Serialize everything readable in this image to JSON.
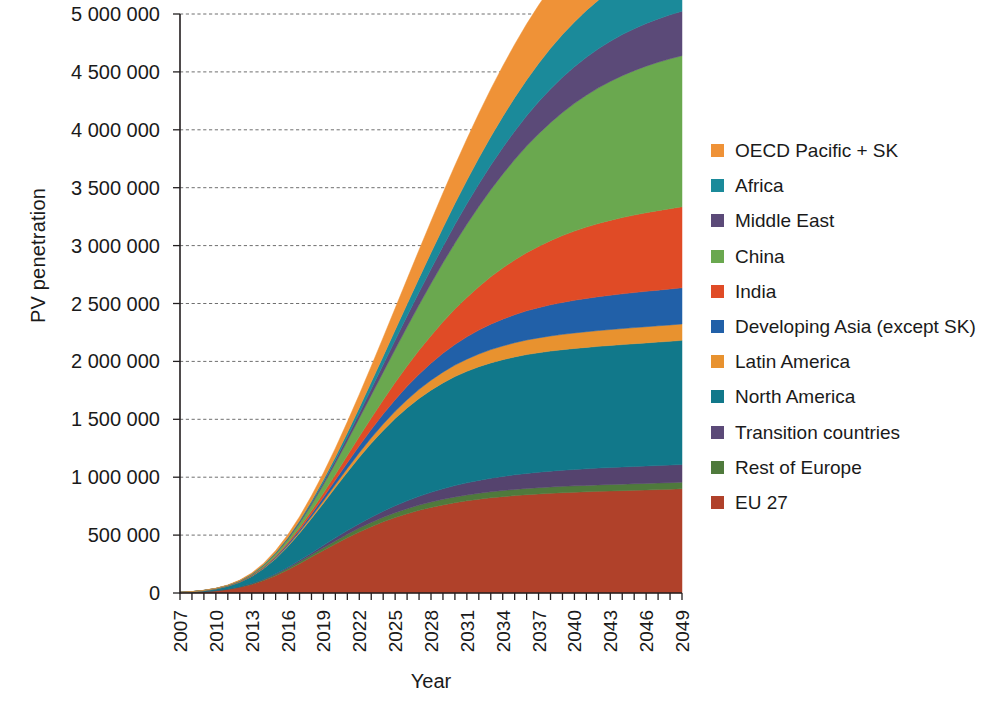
{
  "chart_data": {
    "type": "area",
    "title": "",
    "subtitle": "",
    "xlabel": "Year",
    "ylabel": "PV penetration",
    "xlim": [
      2007,
      2049
    ],
    "ylim": [
      0,
      5000000
    ],
    "grid": true,
    "stacked": true,
    "legend_position": "right",
    "y_tick_labels": [
      "5 000 000",
      "4 500 000",
      "4 000 000",
      "3 500 000",
      "3 000 000",
      "2 500 000",
      "2 000 000",
      "1 500 000",
      "1 000 000",
      "500 000",
      "0"
    ],
    "y_tick_values": [
      5000000,
      4500000,
      4000000,
      3500000,
      3000000,
      2500000,
      2000000,
      1500000,
      1000000,
      500000,
      0
    ],
    "x_tick_labels": [
      "2007",
      "2010",
      "2013",
      "2016",
      "2019",
      "2022",
      "2025",
      "2028",
      "2031",
      "2034",
      "2037",
      "2040",
      "2043",
      "2046",
      "2049"
    ],
    "x_tick_values": [
      2007,
      2010,
      2013,
      2016,
      2019,
      2022,
      2025,
      2028,
      2031,
      2034,
      2037,
      2040,
      2043,
      2046,
      2049
    ],
    "x_minor_step": 1,
    "x": [
      2007,
      2008,
      2009,
      2010,
      2011,
      2012,
      2013,
      2014,
      2015,
      2016,
      2017,
      2018,
      2019,
      2020,
      2021,
      2022,
      2023,
      2024,
      2025,
      2026,
      2027,
      2028,
      2029,
      2030,
      2031,
      2032,
      2033,
      2034,
      2035,
      2036,
      2037,
      2038,
      2039,
      2040,
      2041,
      2042,
      2043,
      2044,
      2045,
      2046,
      2047,
      2048,
      2049
    ],
    "series_order_bottom_to_top": [
      "EU 27",
      "Rest of Europe",
      "Transition countries",
      "North America",
      "Latin America",
      "Developing Asia (except SK)",
      "India",
      "China",
      "Middle East",
      "Africa",
      "OECD Pacific + SK"
    ],
    "series": [
      {
        "name": "EU 27",
        "color": "#b0412a",
        "values": [
          3000,
          6000,
          11000,
          19000,
          31000,
          49000,
          74000,
          108000,
          150000,
          199000,
          253000,
          310000,
          367000,
          423000,
          477000,
          527000,
          573000,
          615000,
          652000,
          685000,
          714000,
          739000,
          761000,
          780000,
          796000,
          810000,
          822000,
          832000,
          841000,
          849000,
          855000,
          861000,
          866000,
          870000,
          874000,
          878000,
          881000,
          884000,
          887000,
          890000,
          893000,
          896000,
          900000
        ]
      },
      {
        "name": "Rest of Europe",
        "color": "#4f7a3c",
        "values": [
          200,
          400,
          700,
          1200,
          2000,
          3100,
          4700,
          6900,
          9500,
          12600,
          16000,
          19600,
          23200,
          26800,
          30200,
          33400,
          36300,
          38900,
          41300,
          43400,
          45200,
          46800,
          48200,
          49400,
          50400,
          51300,
          52100,
          52700,
          53300,
          53800,
          54200,
          54600,
          54900,
          55200,
          55400,
          55700,
          55900,
          56100,
          56300,
          56500,
          56700,
          56900,
          57000
        ]
      },
      {
        "name": "Transition countries",
        "color": "#55436e",
        "values": [
          100,
          200,
          400,
          700,
          1200,
          2000,
          3100,
          4700,
          6800,
          9500,
          12800,
          16700,
          21200,
          26300,
          32000,
          38300,
          45100,
          52400,
          60000,
          67800,
          75700,
          83500,
          91100,
          98300,
          105000,
          111200,
          116800,
          121800,
          126300,
          130200,
          133700,
          136700,
          139300,
          141600,
          143600,
          145300,
          146800,
          148100,
          149300,
          150300,
          151200,
          152000,
          152700
        ]
      },
      {
        "name": "North America",
        "color": "#11788a",
        "values": [
          2000,
          4000,
          8000,
          14000,
          24000,
          39000,
          61000,
          91000,
          130000,
          178000,
          234000,
          297000,
          364000,
          434000,
          504000,
          573000,
          638000,
          698000,
          753000,
          802000,
          845000,
          882000,
          914000,
          941000,
          963000,
          981000,
          996000,
          1008000,
          1018000,
          1026000,
          1032000,
          1037000,
          1041000,
          1045000,
          1048000,
          1051000,
          1054000,
          1057000,
          1060000,
          1063000,
          1066000,
          1069000,
          1072000
        ]
      },
      {
        "name": "Latin America",
        "color": "#e8922f",
        "values": [
          100,
          200,
          400,
          700,
          1100,
          1800,
          2900,
          4400,
          6400,
          9000,
          12300,
          16300,
          21100,
          26700,
          33000,
          40000,
          47400,
          55200,
          63100,
          71000,
          78700,
          86100,
          93000,
          99400,
          105200,
          110400,
          115000,
          119000,
          122500,
          125500,
          128100,
          130300,
          132200,
          133800,
          135200,
          136400,
          137400,
          138300,
          139100,
          139800,
          140400,
          140900,
          141400
        ]
      },
      {
        "name": "Developing Asia (except SK)",
        "color": "#2160a8",
        "values": [
          100,
          200,
          400,
          800,
          1400,
          2300,
          3700,
          5700,
          8400,
          12000,
          16600,
          22400,
          29500,
          38000,
          47900,
          59200,
          71700,
          85400,
          100000,
          115300,
          131000,
          146800,
          162400,
          177600,
          192300,
          206200,
          219200,
          231200,
          242200,
          252100,
          261000,
          268900,
          275900,
          282000,
          287400,
          292100,
          296200,
          299800,
          302900,
          305700,
          308100,
          310300,
          312200
        ]
      },
      {
        "name": "India",
        "color": "#e04b26",
        "values": [
          100,
          200,
          400,
          800,
          1400,
          2400,
          3900,
          6200,
          9400,
          13800,
          19700,
          27300,
          36900,
          48800,
          63200,
          80200,
          100000,
          122600,
          148000,
          176000,
          206200,
          238300,
          271700,
          306000,
          340700,
          375100,
          408900,
          441500,
          472600,
          501900,
          529200,
          554400,
          577200,
          597800,
          616100,
          632200,
          646300,
          658600,
          669300,
          678600,
          686600,
          693500,
          699400
        ]
      },
      {
        "name": "China",
        "color": "#6aa84f",
        "values": [
          200,
          400,
          800,
          1500,
          2700,
          4600,
          7500,
          11900,
          18200,
          27000,
          38800,
          54100,
          73400,
          97100,
          125500,
          158800,
          196900,
          239800,
          287100,
          338400,
          393100,
          450600,
          510100,
          570800,
          631900,
          692700,
          752600,
          810900,
          867200,
          920900,
          971600,
          1019000,
          1062800,
          1102900,
          1139100,
          1171500,
          1200200,
          1225300,
          1247000,
          1265600,
          1281400,
          1294600,
          1305500
        ]
      },
      {
        "name": "Middle East",
        "color": "#5b4a78",
        "values": [
          0,
          100,
          200,
          400,
          700,
          1200,
          2000,
          3200,
          4900,
          7300,
          10500,
          14700,
          20000,
          26500,
          34300,
          43400,
          53900,
          65700,
          78900,
          93200,
          108500,
          124700,
          141500,
          158800,
          176400,
          194000,
          211500,
          228600,
          245200,
          261200,
          276400,
          290700,
          304000,
          316200,
          327400,
          337500,
          346600,
          354800,
          362100,
          368700,
          374500,
          379700,
          384300
        ]
      },
      {
        "name": "Africa",
        "color": "#1b8a9a",
        "values": [
          0,
          100,
          200,
          400,
          700,
          1200,
          2000,
          3200,
          5000,
          7500,
          10900,
          15400,
          21100,
          28200,
          36800,
          47000,
          58800,
          72200,
          87200,
          103700,
          121500,
          140500,
          160500,
          181200,
          202600,
          224300,
          246100,
          267900,
          289400,
          310500,
          331000,
          350700,
          369600,
          387400,
          404200,
          419800,
          434200,
          447400,
          459400,
          470200,
          479900,
          488600,
          496300
        ]
      },
      {
        "name": "OECD Pacific + SK",
        "color": "#ef9237",
        "values": [
          300,
          600,
          1100,
          1900,
          3100,
          5000,
          7900,
          12000,
          17600,
          25000,
          34300,
          45800,
          59500,
          75600,
          94000,
          114700,
          137500,
          162100,
          188200,
          215500,
          243600,
          272200,
          300900,
          329300,
          357200,
          384400,
          410700,
          435800,
          459600,
          482000,
          502800,
          522100,
          539800,
          556000,
          570700,
          584000,
          596000,
          606800,
          616400,
          625000,
          632700,
          639600,
          645700
        ]
      }
    ]
  },
  "legend": {
    "items": [
      {
        "label": "OECD Pacific + SK",
        "color": "#ef9237"
      },
      {
        "label": "Africa",
        "color": "#1b8a9a"
      },
      {
        "label": "Middle East",
        "color": "#5b4a78"
      },
      {
        "label": "China",
        "color": "#6aa84f"
      },
      {
        "label": "India",
        "color": "#e04b26"
      },
      {
        "label": "Developing Asia (except SK)",
        "color": "#2160a8"
      },
      {
        "label": "Latin America",
        "color": "#e8922f"
      },
      {
        "label": "North America",
        "color": "#11788a"
      },
      {
        "label": "Transition countries",
        "color": "#5b4a78"
      },
      {
        "label": "Rest of Europe",
        "color": "#4f7a3c"
      },
      {
        "label": "EU 27",
        "color": "#b0412a"
      }
    ]
  },
  "axes": {
    "y_title": "PV penetration",
    "x_title": "Year"
  }
}
